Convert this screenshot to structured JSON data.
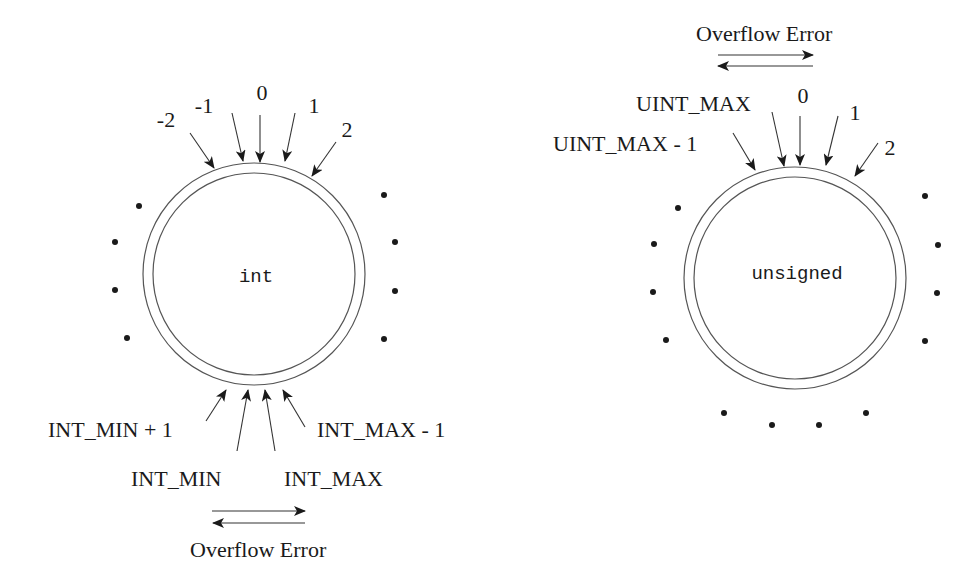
{
  "diagram": {
    "left": {
      "type_label": "int",
      "top_labels": [
        "-2",
        "-1",
        "0",
        "1",
        "2"
      ],
      "bottom_labels": {
        "int_min_plus_1": "INT_MIN + 1",
        "int_min": "INT_MIN",
        "int_max": "INT_MAX",
        "int_max_minus_1": "INT_MAX - 1"
      },
      "overflow_label": "Overflow Error"
    },
    "right": {
      "type_label": "unsigned",
      "top_labels": {
        "uint_max_minus_1": "UINT_MAX - 1",
        "uint_max": "UINT_MAX",
        "zero": "0",
        "one": "1",
        "two": "2"
      },
      "overflow_label": "Overflow Error"
    }
  }
}
